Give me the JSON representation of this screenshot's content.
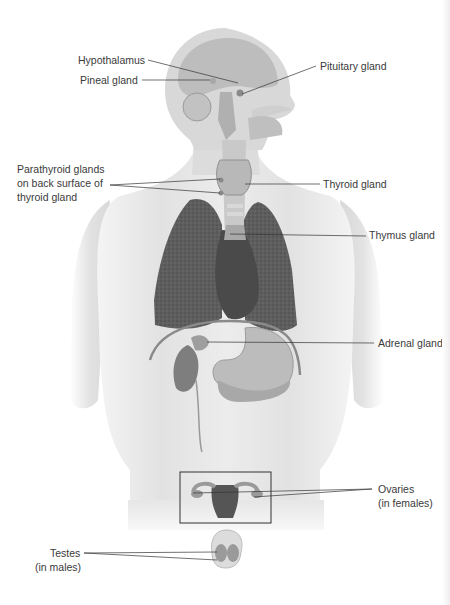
{
  "figure": {
    "labels": {
      "hypothalamus": "Hypothalamus",
      "pineal": "Pineal gland",
      "pituitary": "Pituitary gland",
      "parathyroid_line1": "Parathyroid glands",
      "parathyroid_line2": "on back surface of",
      "parathyroid_line3": "thyroid gland",
      "thyroid": "Thyroid gland",
      "thymus": "Thymus gland",
      "adrenal": "Adrenal gland",
      "ovaries_line1": "Ovaries",
      "ovaries_line2": "(in females)",
      "testes_line1": "Testes",
      "testes_line2": "(in males)"
    },
    "colors": {
      "body_skin": "#e6e6e6",
      "body_shadow": "#d2d2d2",
      "organ_dark": "#5a5a5a",
      "organ_mid": "#9a9a9a",
      "organ_light": "#bdbdbd",
      "leader_line": "#333333",
      "text": "#3a3a3a"
    }
  }
}
